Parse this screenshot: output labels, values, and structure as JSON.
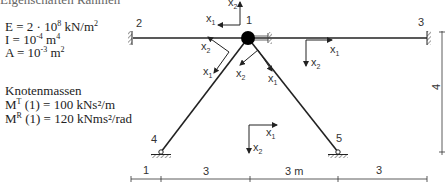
{
  "header_cut": "Eigenschaften Rahmen",
  "properties": {
    "E": {
      "name": "E",
      "value": "2 · 10",
      "exp": "8",
      "unit": " kN/m",
      "unit_exp": "2"
    },
    "I": {
      "name": "I",
      "value": "10",
      "exp": "-4",
      "unit": " m",
      "unit_exp": "4"
    },
    "A": {
      "name": "A",
      "value": "10",
      "exp": "-3",
      "unit": " m",
      "unit_exp": "2"
    }
  },
  "masses": {
    "title": "Knotenmassen",
    "MT": {
      "label": "M",
      "sup": "T",
      "rest": " (1) = 100 kNs²/m"
    },
    "MR": {
      "label": "M",
      "sup": "R",
      "rest": " (1) = 120  kNms²/rad"
    }
  },
  "nodes": {
    "n1": "1",
    "n2": "2",
    "n3": "3",
    "n4": "4",
    "n5": "5"
  },
  "axes": {
    "x1": "x",
    "x2": "x",
    "sub1": "1",
    "sub2": "2"
  },
  "dimensions": {
    "d1": "1",
    "d2": "3",
    "d3": "3 m",
    "d4": "3",
    "vertical": "4"
  }
}
